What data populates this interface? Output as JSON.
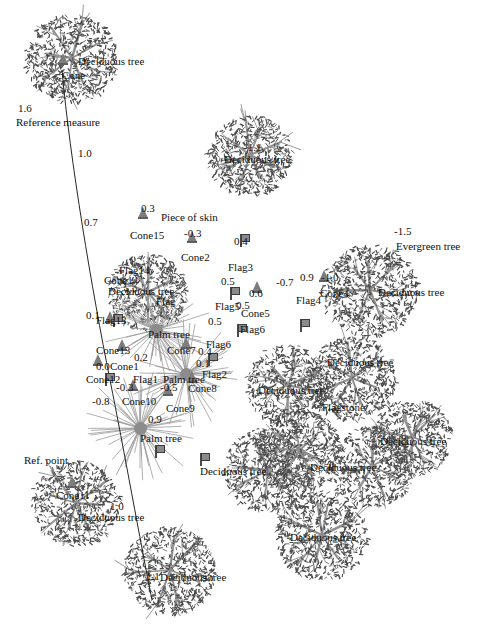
{
  "figure": {
    "background_color": "#ffffff",
    "ink_color": "#1a1a1a",
    "marker_color": "#8a8a8a"
  },
  "annotations": {
    "reference_measure_label": "Reference measure",
    "reference_point_label": "Ref. point",
    "reference_values": [
      "1.6",
      "1.0",
      "0.7",
      "0.1",
      "1.0"
    ]
  },
  "chart_data": {
    "type": "scatter",
    "xlabel": "",
    "ylabel": "",
    "grid": false,
    "legend": "none",
    "axis_note": "Image-space pixel coordinates, origin at top-left of 482x631 canvas",
    "marker_kinds": [
      "cone",
      "flag",
      "palm",
      "tree-canopy"
    ],
    "points": [
      {
        "id": "t1",
        "kind": "tree-canopy",
        "label": "Deciduous tree",
        "value": null,
        "x": 72,
        "y": 58,
        "r": 46
      },
      {
        "id": "c0",
        "kind": "cone",
        "label": "Cone",
        "value": null,
        "x": 63,
        "y": 64
      },
      {
        "id": "t2",
        "kind": "tree-canopy",
        "label": "Deciduous tree",
        "value": "-1.1",
        "x": 250,
        "y": 155,
        "r": 42
      },
      {
        "id": "c15",
        "kind": "cone",
        "label": "Cone15",
        "value": "0.3",
        "x": 143,
        "y": 218
      },
      {
        "id": "sk1",
        "kind": "note",
        "label": "Piece of skin",
        "value": null,
        "x": 158,
        "y": 212
      },
      {
        "id": "c2",
        "kind": "cone",
        "label": "Cone2",
        "value": "-0.3",
        "x": 192,
        "y": 242
      },
      {
        "id": "f3",
        "kind": "flag",
        "label": "Flag3",
        "value": "0.4",
        "x": 245,
        "y": 247
      },
      {
        "id": "f5",
        "kind": "flag",
        "label": "Flag5",
        "value": "0.5",
        "x": 235,
        "y": 287
      },
      {
        "id": "c5",
        "kind": "cone",
        "label": "Cone5",
        "value": "0.6",
        "x": 257,
        "y": 292
      },
      {
        "id": "n07",
        "kind": "note",
        "label": "",
        "value": "-0.7",
        "x": 281,
        "y": 275
      },
      {
        "id": "f6a",
        "kind": "flag",
        "label": "Flag6",
        "value": "0.5",
        "x": 242,
        "y": 311
      },
      {
        "id": "f6b",
        "kind": "flag",
        "label": "Flag6",
        "value": "0.5",
        "x": 213,
        "y": 327
      },
      {
        "id": "f4",
        "kind": "flag",
        "label": "Flag4",
        "value": "0.9",
        "x": 305,
        "y": 280
      },
      {
        "id": "c4",
        "kind": "cone",
        "label": "Cone4",
        "value": "-1.0",
        "x": 324,
        "y": 281
      },
      {
        "id": "eg",
        "kind": "note",
        "label": "Evergreen tree",
        "value": "-1.5",
        "x": 398,
        "y": 228
      },
      {
        "id": "t3",
        "kind": "tree-canopy",
        "label": "Deciduous tree",
        "value": null,
        "x": 370,
        "y": 290,
        "r": 48
      },
      {
        "id": "f14",
        "kind": "flag",
        "label": "Flag14",
        "value": null,
        "x": 118,
        "y": 262
      },
      {
        "id": "t4",
        "kind": "tree-canopy",
        "label": "Deciduous tree",
        "value": null,
        "x": 148,
        "y": 292,
        "r": 40
      },
      {
        "id": "f13",
        "kind": "flag",
        "label": "Flag13",
        "value": "0.1",
        "x": 110,
        "y": 308
      },
      {
        "id": "c13",
        "kind": "cone",
        "label": "Cone13",
        "value": null,
        "x": 110,
        "y": 322
      },
      {
        "id": "pt1",
        "kind": "palm",
        "label": "Palm tree",
        "value": null,
        "x": 156,
        "y": 330
      },
      {
        "id": "c1",
        "kind": "cone",
        "label": "Cone1",
        "value": "0.2",
        "x": 122,
        "y": 350
      },
      {
        "id": "c7",
        "kind": "cone",
        "label": "Cone7",
        "value": "0.4",
        "x": 186,
        "y": 348
      },
      {
        "id": "c12",
        "kind": "cone",
        "label": "Cone12",
        "value": "0.0",
        "x": 98,
        "y": 365
      },
      {
        "id": "f1",
        "kind": "flag",
        "label": "Flag1",
        "value": null,
        "x": 160,
        "y": 367
      },
      {
        "id": "f2",
        "kind": "flag",
        "label": "Flag2",
        "value": "0.1",
        "x": 205,
        "y": 362
      },
      {
        "id": "pt2",
        "kind": "palm",
        "label": "Palm tree",
        "value": null,
        "x": 186,
        "y": 374
      },
      {
        "id": "c10",
        "kind": "cone",
        "label": "Cone10",
        "value": "-0.3",
        "x": 133,
        "y": 390
      },
      {
        "id": "c9",
        "kind": "cone",
        "label": "Cone9",
        "value": "-0.5",
        "x": 168,
        "y": 395
      },
      {
        "id": "c8",
        "kind": "cone",
        "label": "Cone8",
        "value": null,
        "x": 192,
        "y": 382
      },
      {
        "id": "n08",
        "kind": "note",
        "label": "",
        "value": "-0.8",
        "x": 100,
        "y": 395
      },
      {
        "id": "pt3",
        "kind": "palm",
        "label": "Palm tree",
        "value": "0.9",
        "x": 140,
        "y": 428
      },
      {
        "id": "c11",
        "kind": "cone",
        "label": "Cone11",
        "value": null,
        "x": 72,
        "y": 487
      },
      {
        "id": "t5",
        "kind": "tree-canopy",
        "label": "Deciduous tree",
        "value": "1.0",
        "x": 76,
        "y": 503,
        "r": 44
      },
      {
        "id": "t6",
        "kind": "tree-canopy",
        "label": "Deciduous tree",
        "value": "1.1",
        "x": 170,
        "y": 570,
        "r": 46
      },
      {
        "id": "t7",
        "kind": "tree-canopy",
        "label": "Deciduous tree",
        "value": null,
        "x": 322,
        "y": 535,
        "r": 46
      },
      {
        "id": "t8",
        "kind": "tree-canopy",
        "label": "Deciduous tree",
        "value": null,
        "x": 268,
        "y": 470,
        "r": 44
      },
      {
        "id": "t9",
        "kind": "tree-canopy",
        "label": "Deciduous tree",
        "value": null,
        "x": 372,
        "y": 466,
        "r": 42
      },
      {
        "id": "t10",
        "kind": "tree-canopy",
        "label": "Deciduous tree",
        "value": null,
        "x": 412,
        "y": 437,
        "r": 40
      },
      {
        "id": "t11",
        "kind": "tree-canopy",
        "label": "Deciduous tree",
        "value": null,
        "x": 352,
        "y": 378,
        "r": 44
      },
      {
        "id": "t12",
        "kind": "tree-canopy",
        "label": "Deciduous tree",
        "value": null,
        "x": 288,
        "y": 385,
        "r": 42
      },
      {
        "id": "fs",
        "kind": "note",
        "label": "Flagstone",
        "value": null,
        "x": 336,
        "y": 400
      },
      {
        "id": "t13",
        "kind": "tree-canopy",
        "label": "Deciduous tree",
        "value": null,
        "x": 300,
        "y": 450,
        "r": 42
      }
    ]
  },
  "labels": [
    {
      "name": "tree-label-top-left",
      "text": "Deciduous tree",
      "x": 78,
      "y": 56,
      "cls": "name"
    },
    {
      "name": "cone-label-top-left",
      "text": "Cone",
      "x": 62,
      "y": 70,
      "cls": "name"
    },
    {
      "name": "ref-value-1-6",
      "text": "1.6",
      "x": 18,
      "y": 103,
      "cls": "num"
    },
    {
      "name": "reference-measure",
      "text": "Reference measure",
      "x": 16,
      "y": 117,
      "cls": "name"
    },
    {
      "name": "ref-value-1-0",
      "text": "1.0",
      "x": 78,
      "y": 148,
      "cls": "num"
    },
    {
      "name": "tree-value-neg-1-1",
      "text": "-1.1",
      "x": 244,
      "y": 142,
      "cls": "num"
    },
    {
      "name": "tree-label-top-mid",
      "text": "Deciduous tree",
      "x": 224,
      "y": 154,
      "cls": "name"
    },
    {
      "name": "ref-value-0-7",
      "text": "0.7",
      "x": 84,
      "y": 217,
      "cls": "num"
    },
    {
      "name": "cone15-value",
      "text": "0.3",
      "x": 141,
      "y": 203,
      "cls": "num"
    },
    {
      "name": "piece-of-skin-label",
      "text": "Piece of skin",
      "x": 161,
      "y": 212,
      "cls": "name"
    },
    {
      "name": "cone15-label",
      "text": "Cone15",
      "x": 130,
      "y": 230,
      "cls": "name"
    },
    {
      "name": "cone2-value",
      "text": "-0.3",
      "x": 184,
      "y": 228,
      "cls": "num"
    },
    {
      "name": "cone2-label",
      "text": "Cone2",
      "x": 181,
      "y": 252,
      "cls": "name"
    },
    {
      "name": "flag3-value",
      "text": "0.4",
      "x": 234,
      "y": 236,
      "cls": "num"
    },
    {
      "name": "flag3-label",
      "text": "Flag3",
      "x": 228,
      "y": 262,
      "cls": "name"
    },
    {
      "name": "evergreen-value",
      "text": "-1.5",
      "x": 394,
      "y": 226,
      "cls": "num"
    },
    {
      "name": "evergreen-label",
      "text": "Evergreen tree",
      "x": 396,
      "y": 241,
      "cls": "name"
    },
    {
      "name": "flag5-value",
      "text": "0.5",
      "x": 221,
      "y": 276,
      "cls": "num"
    },
    {
      "name": "cone5-value",
      "text": "0.6",
      "x": 249,
      "y": 288,
      "cls": "num"
    },
    {
      "name": "note-value-neg-0-7",
      "text": "-0.7",
      "x": 276,
      "y": 277,
      "cls": "num"
    },
    {
      "name": "flag5-label",
      "text": "Flag5",
      "x": 215,
      "y": 301,
      "cls": "name"
    },
    {
      "name": "cone5-label",
      "text": "Cone5",
      "x": 241,
      "y": 308,
      "cls": "name"
    },
    {
      "name": "flag4-value",
      "text": "0.9",
      "x": 300,
      "y": 272,
      "cls": "num"
    },
    {
      "name": "cone4-value",
      "text": "-1.0",
      "x": 321,
      "y": 272,
      "cls": "num"
    },
    {
      "name": "flag4-label",
      "text": "Flag4",
      "x": 296,
      "y": 295,
      "cls": "name"
    },
    {
      "name": "cone4-label",
      "text": "Cone4",
      "x": 320,
      "y": 288,
      "cls": "name"
    },
    {
      "name": "tree-label-right-upper",
      "text": "Deciduous tree",
      "x": 378,
      "y": 287,
      "cls": "name"
    },
    {
      "name": "flag6a-value",
      "text": "0.5",
      "x": 236,
      "y": 300,
      "cls": "num"
    },
    {
      "name": "flag6a-label",
      "text": "Flag6",
      "x": 240,
      "y": 324,
      "cls": "name"
    },
    {
      "name": "flag6b-value",
      "text": "0.5",
      "x": 208,
      "y": 316,
      "cls": "num"
    },
    {
      "name": "flag6b-label",
      "text": "Flag6",
      "x": 206,
      "y": 339,
      "cls": "name"
    },
    {
      "name": "flag14-label",
      "text": "Flag14",
      "x": 119,
      "y": 265,
      "cls": "name"
    },
    {
      "name": "cone14-label",
      "text": "Cone14",
      "x": 104,
      "y": 275,
      "cls": "name"
    },
    {
      "name": "tree-label-cluster",
      "text": "Deciduous tree",
      "x": 108,
      "y": 286,
      "cls": "name"
    },
    {
      "name": "flag-mid-label",
      "text": "Flag",
      "x": 156,
      "y": 296,
      "cls": "name"
    },
    {
      "name": "ref-value-0-1",
      "text": "0.1",
      "x": 86,
      "y": 310,
      "cls": "num"
    },
    {
      "name": "flag13-label",
      "text": "Flag13",
      "x": 96,
      "y": 315,
      "cls": "name"
    },
    {
      "name": "palm-label-a",
      "text": "Palm tree",
      "x": 148,
      "y": 329,
      "cls": "name"
    },
    {
      "name": "cone13-label",
      "text": "Cone13",
      "x": 96,
      "y": 345,
      "cls": "name"
    },
    {
      "name": "cone7-label",
      "text": "Cone7",
      "x": 167,
      "y": 345,
      "cls": "name"
    },
    {
      "name": "cone7-value",
      "text": "0.4",
      "x": 198,
      "y": 346,
      "cls": "num"
    },
    {
      "name": "cone1-value",
      "text": "0.2",
      "x": 134,
      "y": 352,
      "cls": "num"
    },
    {
      "name": "cone1-label",
      "text": "Cone1",
      "x": 110,
      "y": 361,
      "cls": "name"
    },
    {
      "name": "flag2-value",
      "text": "0.1",
      "x": 196,
      "y": 358,
      "cls": "num"
    },
    {
      "name": "flag2-label",
      "text": "Flag2",
      "x": 202,
      "y": 369,
      "cls": "name"
    },
    {
      "name": "cone12-value",
      "text": "0.0",
      "x": 96,
      "y": 361,
      "cls": "num"
    },
    {
      "name": "cone12-label",
      "text": "Cone12",
      "x": 86,
      "y": 374,
      "cls": "name"
    },
    {
      "name": "flag1-label",
      "text": "Flag1",
      "x": 133,
      "y": 374,
      "cls": "name"
    },
    {
      "name": "palm-label-b",
      "text": "Palm tree",
      "x": 163,
      "y": 374,
      "cls": "name"
    },
    {
      "name": "cone10-value",
      "text": "-0.3",
      "x": 116,
      "y": 382,
      "cls": "num"
    },
    {
      "name": "cone9-value",
      "text": "-0.5",
      "x": 160,
      "y": 382,
      "cls": "num"
    },
    {
      "name": "cone8-label",
      "text": "Cone8",
      "x": 188,
      "y": 383,
      "cls": "name"
    },
    {
      "name": "note-value-neg-0-8",
      "text": "-0.8",
      "x": 92,
      "y": 396,
      "cls": "num"
    },
    {
      "name": "cone10-label",
      "text": "Cone10",
      "x": 122,
      "y": 396,
      "cls": "name"
    },
    {
      "name": "cone9-label",
      "text": "Cone9",
      "x": 166,
      "y": 403,
      "cls": "name"
    },
    {
      "name": "palm-value-0-9",
      "text": "0.9",
      "x": 148,
      "y": 414,
      "cls": "num"
    },
    {
      "name": "palm-label-c",
      "text": "Palm tree",
      "x": 140,
      "y": 433,
      "cls": "name"
    },
    {
      "name": "ref-point-label",
      "text": "Ref. point",
      "x": 24,
      "y": 455,
      "cls": "name"
    },
    {
      "name": "cone11-label",
      "text": "Cone11",
      "x": 56,
      "y": 490,
      "cls": "name"
    },
    {
      "name": "ref-value-1-0b",
      "text": "1.0",
      "x": 110,
      "y": 501,
      "cls": "num"
    },
    {
      "name": "tree-label-lower-left",
      "text": "Deciduous tree",
      "x": 78,
      "y": 512,
      "cls": "name"
    },
    {
      "name": "flagstone-label",
      "text": "Flagstone",
      "x": 322,
      "y": 402,
      "cls": "name"
    },
    {
      "name": "tree-label-r1",
      "text": "Deciduous tree",
      "x": 327,
      "y": 357,
      "cls": "name"
    },
    {
      "name": "tree-label-r2",
      "text": "Deciduous tree",
      "x": 258,
      "y": 385,
      "cls": "name"
    },
    {
      "name": "tree-label-r3",
      "text": "Deciduous tree",
      "x": 380,
      "y": 436,
      "cls": "name"
    },
    {
      "name": "tree-label-r4",
      "text": "Deciduous tree",
      "x": 310,
      "y": 462,
      "cls": "name"
    },
    {
      "name": "tree-label-r5",
      "text": "Deciduous tree",
      "x": 200,
      "y": 466,
      "cls": "name"
    },
    {
      "name": "tree-label-b1",
      "text": "Deciduous tree",
      "x": 290,
      "y": 532,
      "cls": "name"
    },
    {
      "name": "tree-label-b2",
      "text": "Deciduous tree",
      "x": 160,
      "y": 572,
      "cls": "name"
    },
    {
      "name": "tree-value-1-1",
      "text": "1.1",
      "x": 146,
      "y": 571,
      "cls": "num"
    }
  ]
}
